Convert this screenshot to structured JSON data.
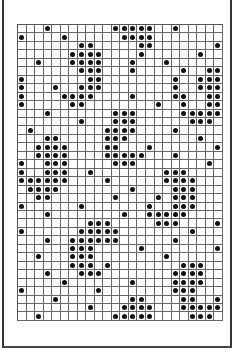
{
  "pattern": {
    "columns": 24,
    "rows": 35,
    "filled_cells_by_row": [
      [
        3,
        11,
        12,
        13,
        14,
        15,
        18
      ],
      [
        0,
        5,
        12,
        13,
        14,
        15
      ],
      [
        7,
        8,
        14,
        15,
        23
      ],
      [
        6,
        7,
        8,
        9,
        14,
        21
      ],
      [
        2,
        6,
        7,
        8,
        9,
        13,
        17
      ],
      [
        7,
        8,
        9,
        13,
        19,
        22,
        23
      ],
      [
        0,
        8,
        9,
        18,
        21,
        22,
        23
      ],
      [
        0,
        4,
        7,
        8,
        9,
        18,
        21,
        22,
        23
      ],
      [
        0,
        5,
        6,
        7,
        8,
        13,
        18,
        19,
        22,
        23
      ],
      [
        0,
        6,
        7,
        16,
        19,
        22,
        23
      ],
      [
        3,
        11,
        12,
        13,
        19,
        20,
        21,
        22,
        23
      ],
      [
        7,
        11,
        12,
        13,
        20,
        21,
        22
      ],
      [
        1,
        10,
        11,
        12,
        13,
        18
      ],
      [
        3,
        4,
        10,
        11,
        12,
        21
      ],
      [
        2,
        3,
        4,
        5,
        10,
        11,
        15,
        23
      ],
      [
        2,
        3,
        4,
        5,
        10,
        11,
        12,
        13,
        14,
        18
      ],
      [
        0,
        3,
        4,
        5,
        11,
        12,
        13,
        22
      ],
      [
        0,
        3,
        4,
        5,
        8,
        17,
        18,
        19
      ],
      [
        0,
        1,
        2,
        3,
        4,
        5,
        10,
        17,
        18,
        19,
        20
      ],
      [
        1,
        2,
        3,
        4,
        13,
        18,
        19,
        20
      ],
      [
        2,
        3,
        11,
        16,
        18,
        19,
        20
      ],
      [
        0,
        7,
        15,
        18,
        19,
        20
      ],
      [
        3,
        12,
        15,
        16,
        17,
        18,
        19
      ],
      [
        8,
        9,
        10,
        16,
        17,
        18,
        23
      ],
      [
        0,
        7,
        8,
        9,
        10,
        11,
        20
      ],
      [
        3,
        6,
        7,
        8,
        9,
        10,
        11,
        18
      ],
      [
        6,
        7,
        8,
        14,
        23
      ],
      [
        2,
        6,
        7,
        8,
        17
      ],
      [
        6,
        7,
        8,
        10,
        19,
        20,
        21
      ],
      [
        3,
        7,
        8,
        9,
        18,
        19,
        20,
        21
      ],
      [
        5,
        13,
        18,
        19,
        20,
        21
      ],
      [
        0,
        9,
        18,
        19,
        20
      ],
      [
        4,
        13,
        14,
        19,
        20,
        23
      ],
      [
        8,
        12,
        13,
        14,
        15,
        19,
        20,
        21,
        22,
        23
      ],
      [
        2,
        11,
        12,
        13,
        14,
        15,
        20,
        21,
        22
      ]
    ],
    "colors": {
      "dot": "#111111",
      "grid_line": "#666666",
      "background": "#ffffff"
    }
  }
}
